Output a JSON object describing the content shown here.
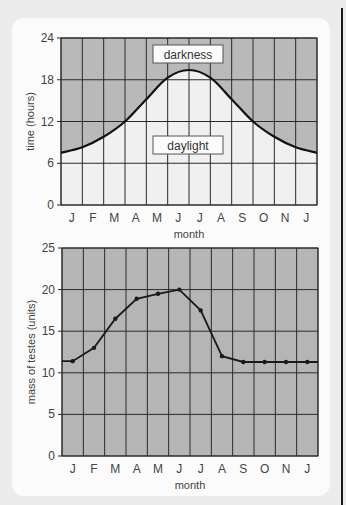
{
  "chart_data": [
    {
      "type": "area",
      "title": "",
      "xlabel": "month",
      "ylabel": "time (hours)",
      "ylim": [
        0,
        24
      ],
      "yticks": [
        0,
        6,
        12,
        18,
        24
      ],
      "categories": [
        "J",
        "F",
        "M",
        "A",
        "M",
        "J",
        "J",
        "A",
        "S",
        "O",
        "N",
        "J"
      ],
      "grid": true,
      "annotations": [
        "darkness",
        "daylight"
      ],
      "series": [
        {
          "name": "daylight",
          "x_boundaries": [
            0,
            1,
            2,
            3,
            4,
            5,
            6,
            7,
            8,
            9,
            10,
            11,
            12
          ],
          "values": [
            7.5,
            8.3,
            9.8,
            12.0,
            15.2,
            18.3,
            19.4,
            18.3,
            15.2,
            12.0,
            9.8,
            8.3,
            7.5
          ]
        }
      ],
      "colors": {
        "darkness": "#b9b9b9",
        "daylight": "#f0f0f0"
      }
    },
    {
      "type": "line",
      "title": "",
      "xlabel": "month",
      "ylabel": "mass of testes (units)",
      "ylim": [
        0,
        25
      ],
      "yticks": [
        0,
        5,
        10,
        15,
        20,
        25
      ],
      "categories": [
        "J",
        "F",
        "M",
        "A",
        "M",
        "J",
        "J",
        "A",
        "S",
        "O",
        "N",
        "J"
      ],
      "grid": true,
      "series": [
        {
          "name": "mass of testes",
          "values": [
            11.4,
            13.0,
            16.5,
            18.9,
            19.5,
            20.0,
            17.5,
            12.0,
            11.3,
            11.3,
            11.3,
            11.3
          ]
        }
      ],
      "colors": {
        "background": "#b5b5b5",
        "line": "#1a1a1a"
      }
    }
  ],
  "top_chart": {
    "ylabel": "time (hours)",
    "xlabel": "month",
    "darkness_label": "darkness",
    "daylight_label": "daylight"
  },
  "bottom_chart": {
    "ylabel": "mass of testes (units)",
    "xlabel": "month"
  }
}
